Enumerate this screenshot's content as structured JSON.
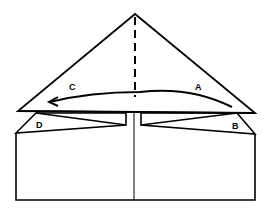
{
  "diagram": {
    "type": "origami-fold-instruction",
    "labels": {
      "a": "A",
      "b": "B",
      "c": "C",
      "d": "D"
    },
    "colors": {
      "stroke": "#000000",
      "background": "#ffffff"
    },
    "elements": [
      "triangle-top-flap",
      "dashed-center-fold-line",
      "curved-fold-arrow",
      "left-flap-d",
      "right-flap-b",
      "base-rectangle",
      "center-crease-line"
    ]
  }
}
